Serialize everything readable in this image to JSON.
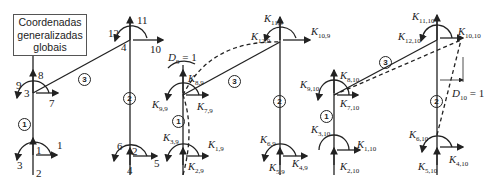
{
  "legend": {
    "line1": "Coordenadas",
    "line2": "generalizadas",
    "line3": "globais"
  },
  "frame1": {
    "nodes": [
      "1",
      "2",
      "3",
      "4"
    ],
    "dofs": [
      "1",
      "2",
      "3",
      "4",
      "5",
      "6",
      "7",
      "8",
      "9",
      "10",
      "11",
      "12"
    ],
    "members": [
      "1",
      "2",
      "3"
    ]
  },
  "frame2": {
    "k_labels": {
      "k1": "K",
      "k1s": "1,9",
      "k2": "K",
      "k2s": "2,9",
      "k3": "K",
      "k3s": "3,9",
      "k7": "K",
      "k7s": "7,9",
      "k8": "K",
      "k8s": "8,9",
      "k9": "K",
      "k9s": "9,9"
    },
    "disp_label": "D",
    "disp_sub": "9",
    "disp_value": " = 1",
    "members": [
      "1",
      "3"
    ]
  },
  "frame3": {
    "k_labels": {
      "k4s": "4,9",
      "k5s": "5,9",
      "k6s": "6,9",
      "k10s": "10,9",
      "k11s": "11,9",
      "k12s": "12,9"
    },
    "members": [
      "2"
    ]
  },
  "frame4": {
    "k_labels": {
      "k1s": "1,10",
      "k2s": "2,10",
      "k3s": "3,10",
      "k7s": "7,10",
      "k8s": "8,10",
      "k9s": "9,10"
    },
    "members": [
      "1",
      "3"
    ]
  },
  "frame5": {
    "k_labels": {
      "k4s": "4,10",
      "k5s": "5,10",
      "k6s": "6,10",
      "k10s": "10,10",
      "k11s": "11,10",
      "k12s": "12,10"
    },
    "disp_label": "D",
    "disp_sub": "10",
    "disp_value": " = 1",
    "members": [
      "2"
    ]
  },
  "k_symbol": "K"
}
